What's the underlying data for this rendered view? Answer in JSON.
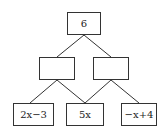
{
  "diagram": {
    "type": "number-pyramid",
    "top": {
      "label": "6"
    },
    "middle": [
      {
        "label": ""
      },
      {
        "label": ""
      }
    ],
    "bottom": [
      {
        "label": "2x−3"
      },
      {
        "label": "5x"
      },
      {
        "label": "−x+4"
      }
    ],
    "colors": {
      "line": "#333333",
      "box_border": "#333333",
      "text": "#222222",
      "background": "#ffffff"
    }
  }
}
